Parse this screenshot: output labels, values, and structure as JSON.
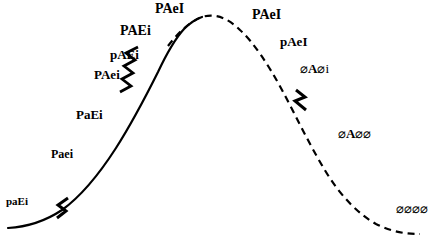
{
  "figure": {
    "title": "",
    "type": "annotated-curve",
    "width": 443,
    "height": 239,
    "background_color": "#ffffff",
    "line_color": "#000000"
  },
  "curve": {
    "description": "bell-shaped rising-then-falling curve",
    "left_style": "solid",
    "right_style": "dashed",
    "stroke_color": "#000000",
    "stroke_width": 2,
    "dash_pattern": "7 5",
    "transition_x": 168,
    "peak": {
      "x": 200,
      "y": 17
    }
  },
  "breaks": [
    {
      "name": "zigzag-break-lower-left",
      "x": 60,
      "y": 208,
      "angle": -46
    },
    {
      "name": "zigzag-break-mid-left",
      "x": 132,
      "y": 70,
      "angle": -56
    },
    {
      "name": "zigzag-break-right",
      "x": 301,
      "y": 100,
      "angle": 62
    }
  ],
  "labels": [
    {
      "id": "pa-e-i",
      "text": "paEi",
      "x": 6,
      "y": 196,
      "size": 11,
      "style": "bold"
    },
    {
      "id": "p-a-e-i",
      "text": "Paei",
      "x": 51,
      "y": 148,
      "size": 12,
      "style": "bold"
    },
    {
      "id": "p-a-big-e-i",
      "text": "PaEi",
      "x": 76,
      "y": 108,
      "size": 13,
      "style": "bold"
    },
    {
      "id": "p-big-a-e-i",
      "text": "PAei",
      "x": 94,
      "y": 68,
      "size": 13,
      "style": "bold"
    },
    {
      "id": "lower-p-a-e",
      "text": "pAEi",
      "x": 110,
      "y": 48,
      "size": 13,
      "style": "bold"
    },
    {
      "id": "p-a-e-big-i",
      "text": "PAEi",
      "x": 120,
      "y": 24,
      "size": 14,
      "style": "bold"
    },
    {
      "id": "peak-left",
      "text": "PAeI",
      "x": 155,
      "y": 2,
      "size": 14,
      "style": "bold"
    },
    {
      "id": "peak-right",
      "text": "PAeI",
      "x": 252,
      "y": 8,
      "size": 14,
      "style": "bold"
    },
    {
      "id": "right-lower",
      "text": "pAeI",
      "x": 280,
      "y": 35,
      "size": 13,
      "style": "bold"
    },
    {
      "id": "null-a-null-i",
      "text": "⌀A⌀i",
      "x": 300,
      "y": 62,
      "size": 13,
      "style": "null"
    },
    {
      "id": "null-a-null-null",
      "text": "⌀A⌀⌀",
      "x": 338,
      "y": 127,
      "size": 13,
      "style": "null"
    },
    {
      "id": "all-null",
      "text": "⌀⌀⌀⌀",
      "x": 396,
      "y": 202,
      "size": 13,
      "style": "null"
    }
  ]
}
